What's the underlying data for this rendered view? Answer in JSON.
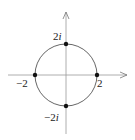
{
  "diagram": {
    "type": "complex-plane-circle",
    "circle": {
      "center": "0",
      "radius": 2
    },
    "points": [
      {
        "name": "top",
        "label_num": "2",
        "label_i": "i"
      },
      {
        "name": "bottom",
        "label_num": "−2",
        "label_i": "i"
      },
      {
        "name": "left",
        "label": "−2"
      },
      {
        "name": "right",
        "label": "2"
      }
    ]
  }
}
